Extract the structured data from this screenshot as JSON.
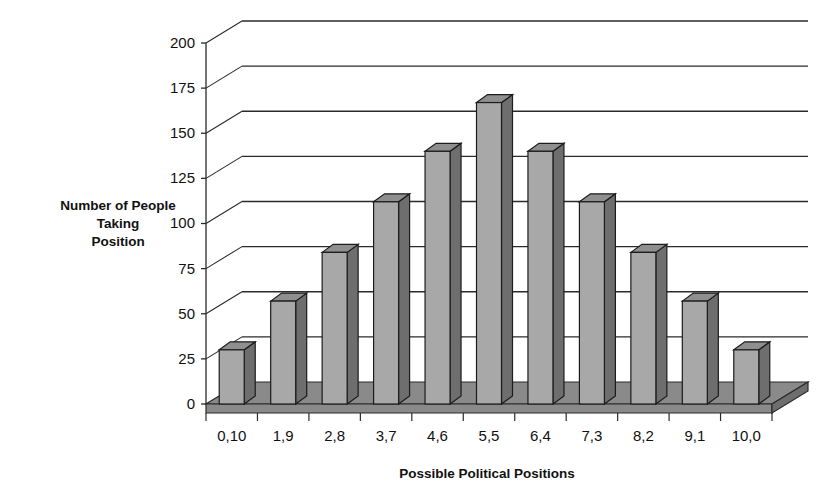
{
  "chart_data": {
    "type": "bar",
    "title": "",
    "xlabel": "Possible Political Positions",
    "ylabel": "Number of People Taking Position",
    "ylabel_lines": [
      "Number of People",
      "Taking",
      "Position"
    ],
    "categories": [
      "0,10",
      "1,9",
      "2,8",
      "3,7",
      "4,6",
      "5,5",
      "6,4",
      "7,3",
      "8,2",
      "9,1",
      "10,0"
    ],
    "values": [
      30,
      57,
      84,
      112,
      140,
      167,
      140,
      112,
      84,
      57,
      30
    ],
    "ylim": [
      0,
      200
    ],
    "ytick_values": [
      0,
      25,
      50,
      75,
      100,
      125,
      150,
      175,
      200
    ],
    "ytick_labels": [
      "0",
      "25",
      "50",
      "75",
      "100",
      "125",
      "150",
      "175",
      "200"
    ],
    "grid": true,
    "legend": "none",
    "style": "3d-column",
    "colors": {
      "bar_front": "#a8a8a8",
      "bar_side": "#6e6e6e",
      "bar_top": "#8f8f8f",
      "bar_outline": "#1c1c1c",
      "floor": "#8a8a8a",
      "floor_top": "#8a8a8a",
      "gridline": "#2b2b2b",
      "axis": "#2b2b2b",
      "background": "#ffffff",
      "text": "#111111"
    }
  }
}
